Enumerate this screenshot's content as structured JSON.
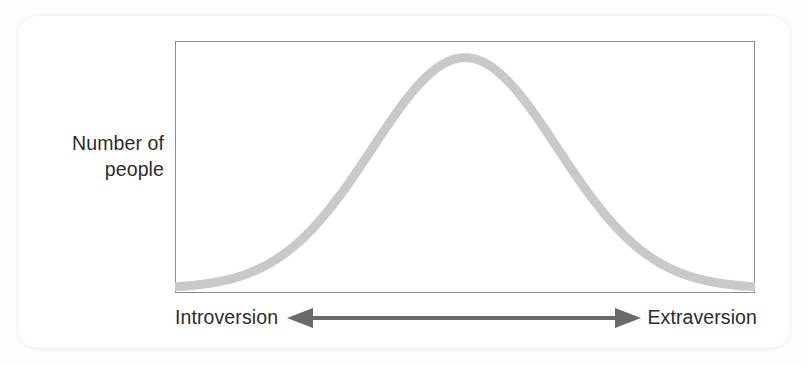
{
  "figure": {
    "card_background": "#ffffff",
    "page_background": "#fdfdfd"
  },
  "axes": {
    "y_label": "Number of\npeople",
    "left_pole_label": "Introversion",
    "right_pole_label": "Extraversion",
    "frame_color": "#8e8e8e",
    "arrow_color": "#6a6a6a",
    "text_color": "#2c2c2c"
  },
  "chart_data": {
    "type": "line",
    "title": "",
    "subtitle": "",
    "xlabel": "",
    "ylabel": "Number of people",
    "x_axis_annotation": {
      "type": "double-headed-arrow",
      "left_end_label": "Introversion",
      "right_end_label": "Extraversion"
    },
    "grid": false,
    "legend": null,
    "xlim": [
      0,
      100
    ],
    "ylim": [
      0,
      1
    ],
    "x_tick_labels": [],
    "y_tick_labels": [],
    "series": [
      {
        "name": "Distribution of people across the introversion–extraversion dimension",
        "curve": "normal",
        "mean": 50,
        "std_dev": 16,
        "peak_x": 50,
        "peak_y": 0.95,
        "color": "#c9c9c9",
        "line_width": 9,
        "x": [
          0,
          5,
          10,
          15,
          20,
          25,
          30,
          35,
          40,
          45,
          50,
          55,
          60,
          65,
          70,
          75,
          80,
          85,
          90,
          95,
          100
        ],
        "values": [
          0.01,
          0.02,
          0.03,
          0.05,
          0.09,
          0.17,
          0.29,
          0.45,
          0.67,
          0.87,
          0.95,
          0.87,
          0.67,
          0.45,
          0.29,
          0.17,
          0.09,
          0.05,
          0.03,
          0.02,
          0.01
        ]
      }
    ]
  }
}
